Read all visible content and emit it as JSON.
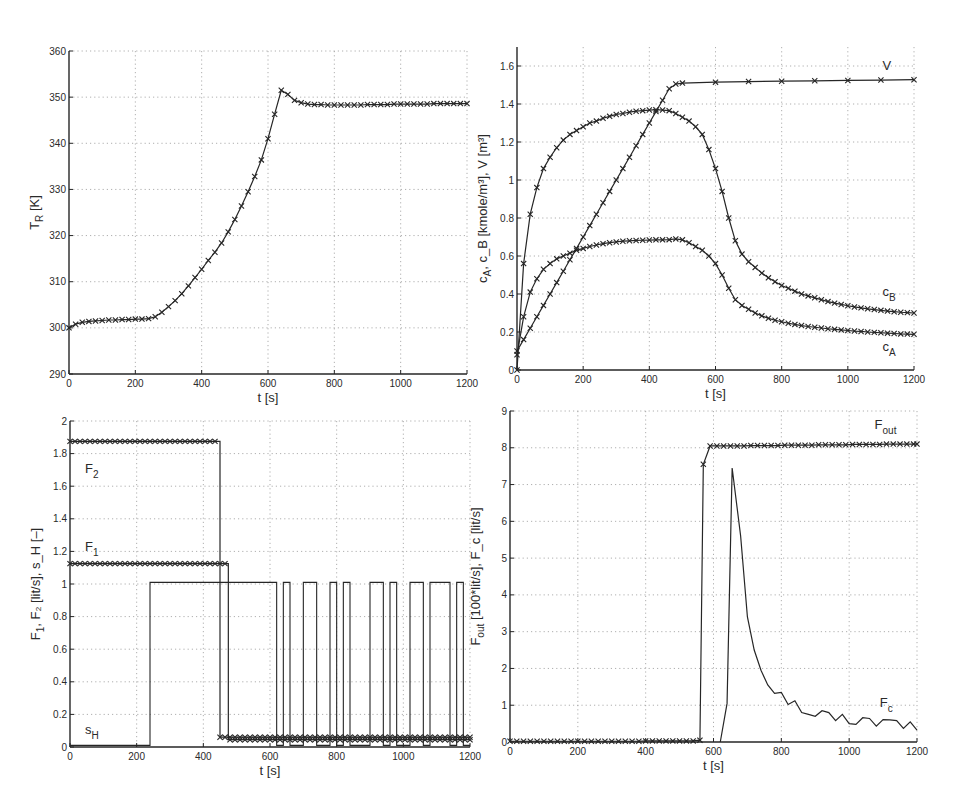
{
  "chart_data": [
    {
      "id": "temperature",
      "type": "line",
      "box": {
        "x0": 69,
        "x1": 467,
        "y0": 51,
        "y1": 374
      },
      "xlim": [
        0,
        1200
      ],
      "ylim": [
        290,
        360
      ],
      "xticks": [
        0,
        200,
        400,
        600,
        800,
        1000,
        1200
      ],
      "yticks": [
        290,
        300,
        310,
        320,
        330,
        340,
        350,
        360
      ],
      "grid": true,
      "xlabel": "t [s]",
      "ylabel": {
        "main": "T",
        "sub": "R",
        "rest": " [K]"
      },
      "series": [
        {
          "name": "T_R",
          "marker": "x",
          "x": [
            0,
            20,
            40,
            60,
            80,
            100,
            120,
            140,
            160,
            180,
            200,
            220,
            240,
            260,
            280,
            300,
            320,
            340,
            360,
            380,
            400,
            420,
            440,
            460,
            480,
            500,
            520,
            540,
            560,
            580,
            600,
            620,
            640,
            660,
            680,
            700,
            720,
            740,
            760,
            780,
            800,
            820,
            840,
            860,
            880,
            900,
            920,
            940,
            960,
            980,
            1000,
            1020,
            1040,
            1060,
            1080,
            1100,
            1120,
            1140,
            1160,
            1180,
            1200
          ],
          "y": [
            300.0,
            300.8,
            301.2,
            301.4,
            301.5,
            301.6,
            301.7,
            301.7,
            301.8,
            301.8,
            301.9,
            301.9,
            302.0,
            302.4,
            303.4,
            304.6,
            305.9,
            307.4,
            309.1,
            310.9,
            312.7,
            314.6,
            316.4,
            318.4,
            320.8,
            323.5,
            326.4,
            329.5,
            332.8,
            336.4,
            341.0,
            346.3,
            351.5,
            350.6,
            349.3,
            348.8,
            348.5,
            348.4,
            348.4,
            348.3,
            348.3,
            348.3,
            348.3,
            348.3,
            348.3,
            348.4,
            348.4,
            348.4,
            348.4,
            348.5,
            348.5,
            348.5,
            348.5,
            348.5,
            348.5,
            348.6,
            348.6,
            348.6,
            348.6,
            348.6,
            348.6
          ]
        }
      ],
      "annotations": []
    },
    {
      "id": "concentration-volume",
      "type": "line",
      "box": {
        "x0": 517,
        "x1": 914,
        "y0": 47,
        "y1": 370
      },
      "xlim": [
        0,
        1200
      ],
      "ylim": [
        0,
        1.7
      ],
      "xticks": [
        0,
        200,
        400,
        600,
        800,
        1000,
        1200
      ],
      "yticks": [
        0,
        0.2,
        0.4,
        0.6,
        0.8,
        1,
        1.2,
        1.4,
        1.6
      ],
      "grid": true,
      "xlabel": "t [s]",
      "ylabel": {
        "main": "c",
        "sub": "A",
        "rest": ", c_B [kmole/m³], V [m³]"
      },
      "series": [
        {
          "name": "V",
          "marker": "x",
          "x": [
            0,
            20,
            40,
            60,
            80,
            100,
            120,
            140,
            160,
            180,
            200,
            220,
            240,
            260,
            280,
            300,
            320,
            340,
            360,
            380,
            400,
            420,
            440,
            460,
            480,
            500,
            600,
            700,
            800,
            900,
            1000,
            1100,
            1200
          ],
          "y": [
            0.1,
            0.16,
            0.22,
            0.28,
            0.34,
            0.4,
            0.46,
            0.52,
            0.58,
            0.64,
            0.7,
            0.76,
            0.82,
            0.88,
            0.94,
            1.0,
            1.06,
            1.12,
            1.18,
            1.24,
            1.3,
            1.36,
            1.42,
            1.48,
            1.505,
            1.51,
            1.515,
            1.518,
            1.52,
            1.522,
            1.524,
            1.526,
            1.528
          ]
        },
        {
          "name": "c_B",
          "marker": "x",
          "x": [
            0,
            20,
            40,
            60,
            80,
            100,
            120,
            140,
            160,
            180,
            200,
            220,
            240,
            260,
            280,
            300,
            320,
            340,
            360,
            380,
            400,
            420,
            440,
            460,
            480,
            500,
            520,
            540,
            560,
            580,
            600,
            620,
            640,
            660,
            680,
            700,
            720,
            740,
            760,
            780,
            800,
            820,
            840,
            860,
            880,
            900,
            920,
            940,
            960,
            980,
            1000,
            1020,
            1040,
            1060,
            1080,
            1100,
            1120,
            1140,
            1160,
            1180,
            1200
          ],
          "y": [
            0.0,
            0.56,
            0.82,
            0.96,
            1.06,
            1.12,
            1.17,
            1.21,
            1.24,
            1.26,
            1.28,
            1.3,
            1.31,
            1.325,
            1.335,
            1.345,
            1.35,
            1.357,
            1.362,
            1.365,
            1.368,
            1.37,
            1.368,
            1.365,
            1.35,
            1.33,
            1.31,
            1.28,
            1.24,
            1.16,
            1.06,
            0.94,
            0.8,
            0.68,
            0.61,
            0.57,
            0.54,
            0.51,
            0.485,
            0.465,
            0.445,
            0.43,
            0.415,
            0.4,
            0.39,
            0.38,
            0.37,
            0.36,
            0.352,
            0.345,
            0.338,
            0.332,
            0.327,
            0.322,
            0.318,
            0.314,
            0.31,
            0.307,
            0.304,
            0.302,
            0.3
          ]
        },
        {
          "name": "c_A",
          "marker": "x",
          "x": [
            0,
            20,
            40,
            60,
            80,
            100,
            120,
            140,
            160,
            180,
            200,
            220,
            240,
            260,
            280,
            300,
            320,
            340,
            360,
            380,
            400,
            420,
            440,
            460,
            480,
            500,
            520,
            540,
            560,
            580,
            600,
            620,
            640,
            660,
            680,
            700,
            720,
            740,
            760,
            780,
            800,
            820,
            840,
            860,
            880,
            900,
            920,
            940,
            960,
            980,
            1000,
            1020,
            1040,
            1060,
            1080,
            1100,
            1120,
            1140,
            1160,
            1180,
            1200
          ],
          "y": [
            0.08,
            0.28,
            0.41,
            0.48,
            0.53,
            0.56,
            0.585,
            0.6,
            0.615,
            0.63,
            0.64,
            0.65,
            0.658,
            0.665,
            0.67,
            0.674,
            0.678,
            0.68,
            0.682,
            0.683,
            0.684,
            0.685,
            0.685,
            0.686,
            0.69,
            0.685,
            0.67,
            0.65,
            0.63,
            0.6,
            0.56,
            0.5,
            0.43,
            0.37,
            0.34,
            0.32,
            0.3,
            0.285,
            0.272,
            0.262,
            0.254,
            0.246,
            0.24,
            0.234,
            0.229,
            0.225,
            0.221,
            0.217,
            0.214,
            0.211,
            0.208,
            0.205,
            0.203,
            0.2,
            0.198,
            0.196,
            0.194,
            0.192,
            0.19,
            0.189,
            0.188
          ]
        }
      ],
      "annotations": [
        {
          "text": "V",
          "x": 1105,
          "y": 1.58
        },
        {
          "text": "c",
          "sub": "B",
          "x": 1105,
          "y": 0.39
        },
        {
          "text": "c",
          "sub": "A",
          "x": 1105,
          "y": 0.1
        }
      ]
    },
    {
      "id": "feed-flows",
      "type": "line",
      "box": {
        "x0": 70,
        "x1": 470,
        "y0": 421,
        "y1": 747
      },
      "xlim": [
        0,
        1200
      ],
      "ylim": [
        0,
        2
      ],
      "xticks": [
        0,
        200,
        400,
        600,
        800,
        1000,
        1200
      ],
      "yticks": [
        0,
        0.2,
        0.4,
        0.6,
        0.8,
        1,
        1.2,
        1.4,
        1.6,
        1.8,
        2
      ],
      "grid": true,
      "xlabel": "t [s]",
      "ylabel": {
        "main": "F",
        "sub": "1",
        "rest": ", F₂ [lit/s], s_H [–]"
      },
      "series": [
        {
          "name": "F_2",
          "marker": "x",
          "step": true,
          "x": [
            0,
            450,
            450,
            1200
          ],
          "y": [
            1.875,
            1.875,
            0.06,
            0.06
          ],
          "marker_x": [
            0,
            15,
            30,
            45,
            60,
            75,
            90,
            105,
            120,
            135,
            150,
            165,
            180,
            195,
            210,
            225,
            240,
            255,
            270,
            285,
            300,
            315,
            330,
            345,
            360,
            375,
            390,
            405,
            420,
            435,
            450,
            465,
            480,
            495,
            510,
            525,
            540,
            555,
            570,
            585,
            600,
            615,
            630,
            645,
            660,
            675,
            690,
            705,
            720,
            735,
            750,
            765,
            780,
            795,
            810,
            825,
            840,
            855,
            870,
            885,
            900,
            915,
            930,
            945,
            960,
            975,
            990,
            1005,
            1020,
            1035,
            1050,
            1065,
            1080,
            1095,
            1110,
            1125,
            1140,
            1155,
            1170,
            1185,
            1200
          ]
        },
        {
          "name": "F_1",
          "marker": "x",
          "step": true,
          "x": [
            0,
            475,
            475,
            1200
          ],
          "y": [
            1.125,
            1.125,
            0.045,
            0.045
          ],
          "marker_x": [
            0,
            15,
            30,
            45,
            60,
            75,
            90,
            105,
            120,
            135,
            150,
            165,
            180,
            195,
            210,
            225,
            240,
            255,
            270,
            285,
            300,
            315,
            330,
            345,
            360,
            375,
            390,
            405,
            420,
            435,
            450,
            465,
            480,
            495,
            510,
            525,
            540,
            555,
            570,
            585,
            600,
            615,
            630,
            645,
            660,
            675,
            690,
            705,
            720,
            735,
            750,
            765,
            780,
            795,
            810,
            825,
            840,
            855,
            870,
            885,
            900,
            915,
            930,
            945,
            960,
            975,
            990,
            1005,
            1020,
            1035,
            1050,
            1065,
            1080,
            1095,
            1110,
            1125,
            1140,
            1155,
            1170,
            1185,
            1200
          ]
        },
        {
          "name": "s_H",
          "marker": "none",
          "step": true,
          "pulses": [
            [
              240,
              620
            ],
            [
              640,
              660
            ],
            [
              700,
              740
            ],
            [
              780,
              800
            ],
            [
              820,
              840
            ],
            [
              900,
              940
            ],
            [
              960,
              980
            ],
            [
              1020,
              1060
            ],
            [
              1080,
              1140
            ],
            [
              1160,
              1180
            ]
          ],
          "high": 1.01,
          "low": 0.01
        }
      ],
      "annotations": [
        {
          "text": "F",
          "sub": "2",
          "x": 45,
          "y": 1.68
        },
        {
          "text": "F",
          "sub": "1",
          "x": 45,
          "y": 1.2
        },
        {
          "text": "s",
          "sub": "H",
          "x": 45,
          "y": 0.08
        }
      ]
    },
    {
      "id": "outflow-coolant",
      "type": "line",
      "box": {
        "x0": 510,
        "x1": 917,
        "y0": 411,
        "y1": 742
      },
      "xlim": [
        0,
        1200
      ],
      "ylim": [
        0,
        9
      ],
      "xticks": [
        0,
        200,
        400,
        600,
        800,
        1000,
        1200
      ],
      "yticks": [
        0,
        1,
        2,
        3,
        4,
        5,
        6,
        7,
        8,
        9
      ],
      "grid": true,
      "xlabel": "t [s]",
      "ylabel": {
        "main": "F",
        "sub": "out",
        "rest": " [100*lit/s], F_c [lit/s]"
      },
      "series": [
        {
          "name": "F_out",
          "marker": "x",
          "x": [
            0,
            20,
            40,
            60,
            80,
            100,
            120,
            140,
            160,
            180,
            200,
            220,
            240,
            260,
            280,
            300,
            320,
            340,
            360,
            380,
            400,
            420,
            440,
            460,
            480,
            500,
            520,
            540,
            560,
            570,
            590,
            610,
            630,
            650,
            670,
            690,
            710,
            730,
            750,
            770,
            790,
            810,
            830,
            850,
            870,
            890,
            910,
            930,
            950,
            970,
            990,
            1010,
            1030,
            1050,
            1070,
            1090,
            1110,
            1130,
            1150,
            1170,
            1190,
            1200
          ],
          "y": [
            0.02,
            0.02,
            0.02,
            0.02,
            0.02,
            0.02,
            0.02,
            0.02,
            0.02,
            0.02,
            0.02,
            0.02,
            0.02,
            0.02,
            0.02,
            0.02,
            0.02,
            0.02,
            0.02,
            0.02,
            0.03,
            0.03,
            0.03,
            0.03,
            0.03,
            0.03,
            0.03,
            0.03,
            0.05,
            7.55,
            8.05,
            8.05,
            8.05,
            8.05,
            8.05,
            8.05,
            8.06,
            8.06,
            8.06,
            8.06,
            8.06,
            8.07,
            8.07,
            8.07,
            8.07,
            8.07,
            8.08,
            8.08,
            8.08,
            8.08,
            8.08,
            8.09,
            8.09,
            8.09,
            8.09,
            8.09,
            8.1,
            8.1,
            8.1,
            8.1,
            8.1,
            8.1
          ]
        },
        {
          "name": "F_c",
          "marker": "none",
          "x": [
            620,
            640,
            655,
            680,
            700,
            720,
            740,
            760,
            780,
            800,
            820,
            840,
            860,
            880,
            900,
            920,
            940,
            960,
            980,
            1000,
            1020,
            1040,
            1060,
            1080,
            1100,
            1120,
            1140,
            1160,
            1180,
            1200
          ],
          "y": [
            0.0,
            1.05,
            7.45,
            5.6,
            3.4,
            2.5,
            1.95,
            1.55,
            1.32,
            1.35,
            1.02,
            1.12,
            0.8,
            0.75,
            0.7,
            0.85,
            0.8,
            0.58,
            0.75,
            0.5,
            0.48,
            0.66,
            0.64,
            0.43,
            0.61,
            0.6,
            0.58,
            0.37,
            0.55,
            0.32
          ]
        }
      ],
      "annotations": [
        {
          "text": "F",
          "sub": "out",
          "x": 1075,
          "y": 8.5
        },
        {
          "text": "F",
          "sub": "c",
          "x": 1090,
          "y": 0.95
        }
      ]
    }
  ]
}
